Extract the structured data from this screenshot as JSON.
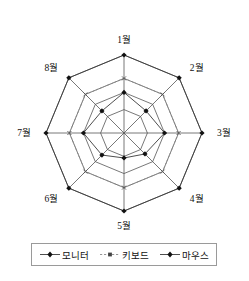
{
  "chart_data": {
    "type": "radar",
    "title": "",
    "categories": [
      "1월",
      "2월",
      "3월",
      "4월",
      "5월",
      "6월",
      "7월",
      "8월"
    ],
    "axis_count": 8,
    "rmax": 100,
    "rings": [
      100,
      70,
      52,
      30
    ],
    "grid": true,
    "legend_position": "bottom",
    "series": [
      {
        "name": "모니터",
        "style": "solid",
        "marker": "diamond",
        "color": "#3a3a3a",
        "values": [
          52,
          40,
          52,
          38,
          32,
          40,
          52,
          40
        ]
      },
      {
        "name": "키보드",
        "style": "dashed",
        "marker": "x",
        "color": "#8a8a8a",
        "values": [
          70,
          70,
          70,
          70,
          70,
          70,
          70,
          70
        ]
      },
      {
        "name": "마우스",
        "style": "solid",
        "marker": "diamond",
        "color": "#3a3a3a",
        "values": [
          100,
          100,
          100,
          100,
          100,
          100,
          100,
          100
        ]
      }
    ],
    "xlabel": "",
    "ylabel": ""
  },
  "legend": {
    "items": [
      {
        "label": "모니터",
        "style": "solid",
        "marker": "diamond"
      },
      {
        "label": "키보드",
        "style": "dashed",
        "marker": "x"
      },
      {
        "label": "마우스",
        "style": "solid",
        "marker": "diamond"
      }
    ]
  }
}
